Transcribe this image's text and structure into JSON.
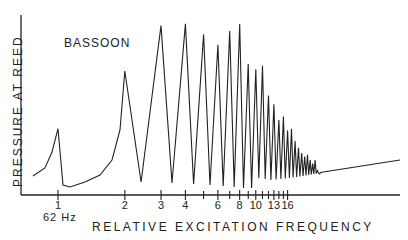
{
  "chart_data": {
    "type": "line",
    "title": "BASSOON",
    "xlabel": "RELATIVE EXCITATION FREQUENCY",
    "ylabel": "PRESSURE AT REED",
    "x_scale": "log",
    "base_frequency_label": "62 Hz",
    "tick_labels": [
      "1",
      "2",
      "3",
      "4",
      "6",
      "8",
      "10",
      "13",
      "16"
    ],
    "tick_values": [
      1,
      2,
      3,
      4,
      6,
      8,
      10,
      13,
      16
    ],
    "grid": false,
    "legend": null,
    "peaks": [
      {
        "harmonic": 1,
        "relative_height": 0.38
      },
      {
        "harmonic": 2,
        "relative_height": 0.71
      },
      {
        "harmonic": 3,
        "relative_height": 0.97
      },
      {
        "harmonic": 4,
        "relative_height": 0.98
      },
      {
        "harmonic": 5,
        "relative_height": 0.92
      },
      {
        "harmonic": 6,
        "relative_height": 0.86
      },
      {
        "harmonic": 7,
        "relative_height": 0.94
      },
      {
        "harmonic": 8,
        "relative_height": 0.98
      },
      {
        "harmonic": 9,
        "relative_height": 0.75
      },
      {
        "harmonic": 10,
        "relative_height": 0.72
      },
      {
        "harmonic": 11,
        "relative_height": 0.74
      },
      {
        "harmonic": 12,
        "relative_height": 0.57
      },
      {
        "harmonic": 13,
        "relative_height": 0.52
      },
      {
        "harmonic": 14,
        "relative_height": 0.43
      },
      {
        "harmonic": 15,
        "relative_height": 0.45
      },
      {
        "harmonic": 16,
        "relative_height": 0.37
      },
      {
        "harmonic": 17,
        "relative_height": 0.38
      },
      {
        "harmonic": 18,
        "relative_height": 0.31
      },
      {
        "harmonic": 19,
        "relative_height": 0.27
      },
      {
        "harmonic": 20,
        "relative_height": 0.24
      },
      {
        "harmonic": 21,
        "relative_height": 0.22
      },
      {
        "harmonic": 22,
        "relative_height": 0.23
      },
      {
        "harmonic": 23,
        "relative_height": 0.2
      },
      {
        "harmonic": 24,
        "relative_height": 0.18
      },
      {
        "harmonic": 25,
        "relative_height": 0.2
      },
      {
        "harmonic": 26,
        "relative_height": 0.14
      },
      {
        "harmonic": 27,
        "relative_height": 0.12
      },
      {
        "harmonic": 28,
        "relative_height": 0.13
      }
    ]
  }
}
